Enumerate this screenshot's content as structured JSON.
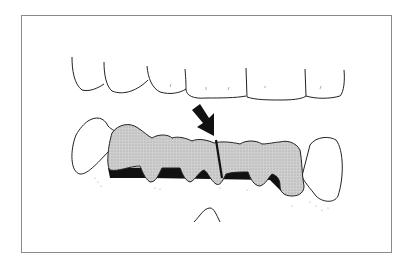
{
  "figure": {
    "type": "dental line illustration",
    "elements": [
      {
        "id": "upper-teeth",
        "label": "Upper anterior teeth (outline)"
      },
      {
        "id": "lower-bridge",
        "label": "Lower fixed partial denture (shaded)"
      },
      {
        "id": "sectioning-line",
        "label": "Sectioning cut line"
      },
      {
        "id": "arrow",
        "label": "Pointer arrow"
      },
      {
        "id": "abutment-left",
        "label": "Left abutment tooth"
      },
      {
        "id": "abutment-right",
        "label": "Right abutment tooth"
      },
      {
        "id": "tongue-tip",
        "label": "Soft tissue outline"
      }
    ],
    "colors": {
      "frame": "#8a8a8a",
      "line": "#222222",
      "shade": "#c8c8c8",
      "stipple": "#8a8a8a",
      "dark": "#111111"
    }
  }
}
